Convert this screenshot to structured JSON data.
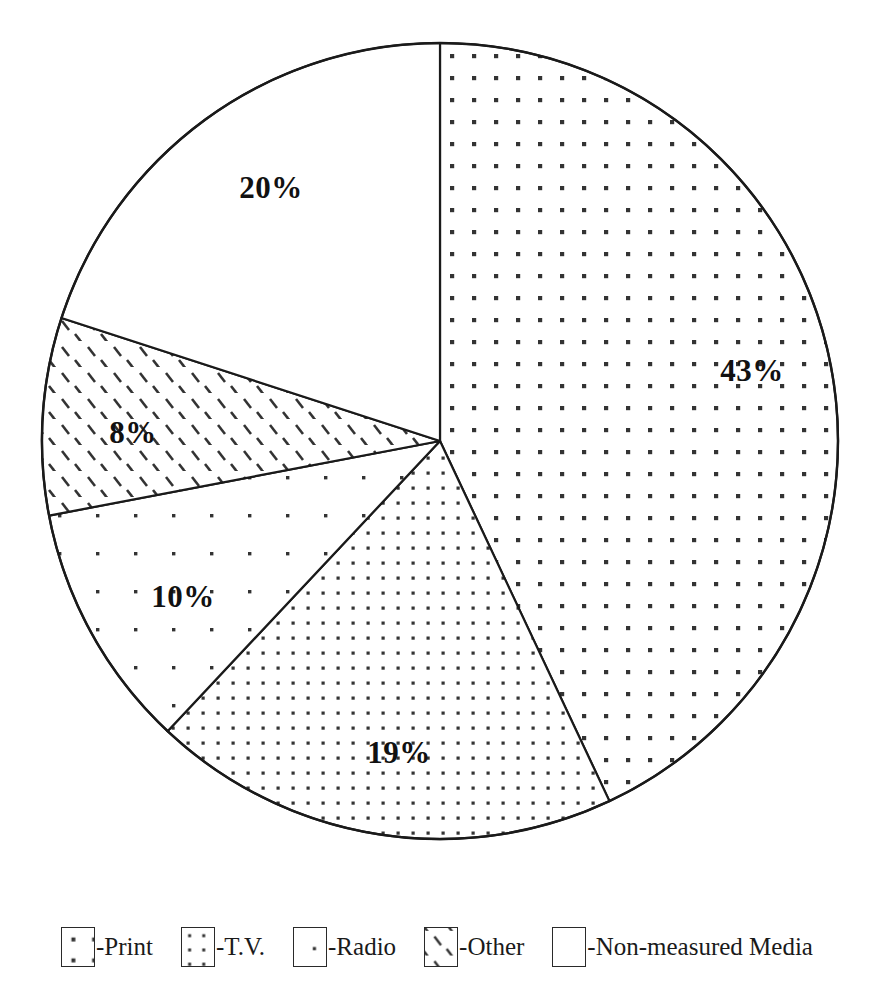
{
  "chart_data": {
    "type": "pie",
    "title": "",
    "subtitle": "",
    "xlabel": "",
    "ylabel": "",
    "grid": false,
    "legend_position": "bottom",
    "start_angle_deg": 0,
    "direction": "clockwise",
    "categories": [
      "Print",
      "T.V.",
      "Radio",
      "Other",
      "Non-measured Media"
    ],
    "values": [
      43,
      19,
      10,
      8,
      20
    ],
    "value_unit": "%",
    "labels": [
      "43%",
      "19%",
      "10%",
      "8%",
      "20%"
    ],
    "slices": [
      {
        "name": "Print",
        "value": 43,
        "label": "43%",
        "pattern": "medium-dots",
        "fill": "#ffffff",
        "pattern_color": "#333333",
        "label_x": 752,
        "label_y": 374
      },
      {
        "name": "T.V.",
        "value": 19,
        "label": "19%",
        "pattern": "dense-dots",
        "fill": "#ffffff",
        "pattern_color": "#333333",
        "label_x": 399,
        "label_y": 756
      },
      {
        "name": "Radio",
        "value": 10,
        "label": "10%",
        "pattern": "sparse-dots",
        "fill": "#ffffff",
        "pattern_color": "#333333",
        "label_x": 183,
        "label_y": 600
      },
      {
        "name": "Other",
        "value": 8,
        "label": "8%",
        "pattern": "diagonal-hatch",
        "fill": "#ffffff",
        "pattern_color": "#333333",
        "label_x": 133,
        "label_y": 436
      },
      {
        "name": "Non-measured Media",
        "value": 20,
        "label": "20%",
        "pattern": "none",
        "fill": "#ffffff",
        "pattern_color": "#333333",
        "label_x": 271,
        "label_y": 191
      }
    ],
    "geometry": {
      "center_x": 440,
      "center_y": 441,
      "radius": 398,
      "stroke": "#1a1a1a",
      "stroke_width": 2
    }
  },
  "legend": {
    "items": [
      {
        "label": "-Print",
        "pattern": "medium-dots",
        "name": "Print"
      },
      {
        "label": "-T.V.",
        "pattern": "dense-dots",
        "name": "T.V."
      },
      {
        "label": "-Radio",
        "pattern": "sparse-dots",
        "name": "Radio"
      },
      {
        "label": "-Other",
        "pattern": "diagonal-hatch",
        "name": "Other"
      },
      {
        "label": "-Non-measured Media",
        "pattern": "none",
        "name": "Non-measured Media"
      }
    ]
  },
  "colors": {
    "background": "#ffffff",
    "ink": "#1a1a1a",
    "pattern": "#333333"
  }
}
